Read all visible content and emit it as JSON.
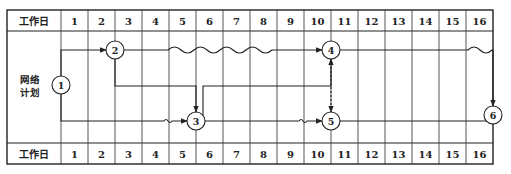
{
  "header": {
    "label": "工作日",
    "days": [
      "1",
      "2",
      "3",
      "4",
      "5",
      "6",
      "7",
      "8",
      "9",
      "10",
      "11",
      "12",
      "13",
      "14",
      "15",
      "16"
    ]
  },
  "footer": {
    "label": "工作日",
    "days": [
      "1",
      "2",
      "3",
      "4",
      "5",
      "6",
      "7",
      "8",
      "9",
      "10",
      "11",
      "12",
      "13",
      "14",
      "15",
      "16"
    ]
  },
  "side_label": {
    "line1": "网络",
    "line2": "计划"
  },
  "nodes": [
    {
      "id": "1",
      "label": "1"
    },
    {
      "id": "2",
      "label": "2"
    },
    {
      "id": "3",
      "label": "3"
    },
    {
      "id": "4",
      "label": "4"
    },
    {
      "id": "5",
      "label": "5"
    },
    {
      "id": "6",
      "label": "6"
    }
  ],
  "arrows": [
    {
      "from": "1",
      "to": "2",
      "type": "solid"
    },
    {
      "from": "1",
      "to": "3",
      "type": "solid-with-free-float"
    },
    {
      "from": "2",
      "to": "4",
      "type": "solid-with-free-float"
    },
    {
      "from": "2",
      "to": "3",
      "type": "solid"
    },
    {
      "from": "3",
      "to": "4",
      "type": "solid"
    },
    {
      "from": "3",
      "to": "5",
      "type": "solid-with-free-float"
    },
    {
      "from": "4",
      "to": "5",
      "type": "dummy-dashed"
    },
    {
      "from": "4",
      "to": "6",
      "type": "solid-with-free-float"
    },
    {
      "from": "5",
      "to": "6",
      "type": "solid"
    }
  ],
  "colors": {
    "line": "#222222",
    "grid": "#555555",
    "background": "#ffffff"
  }
}
